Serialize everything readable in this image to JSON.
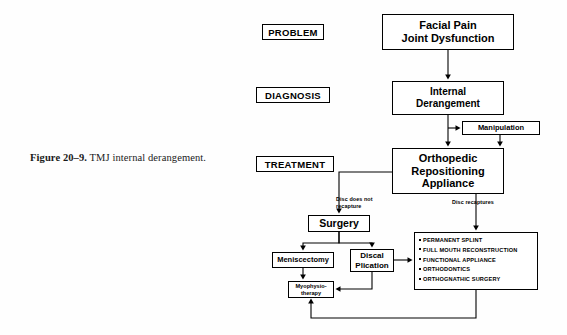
{
  "figure": {
    "caption_number": "Figure 20–9.",
    "caption_text": " TMJ internal derangement."
  },
  "stage_labels": {
    "problem": "PROBLEM",
    "diagnosis": "DIAGNOSIS",
    "treatment": "TREATMENT"
  },
  "nodes": {
    "problem": "Facial Pain\nJoint Dysfunction",
    "problem_line1": "Facial Pain",
    "problem_line2": "Joint Dysfunction",
    "diagnosis_line1": "Internal",
    "diagnosis_line2": "Derangement",
    "manipulation": "Manipulation",
    "treatment_line1": "Orthopedic",
    "treatment_line2": "Repositioning",
    "treatment_line3": "Appliance",
    "surgery": "Surgery",
    "meniscectomy": "Meniscectomy",
    "discal_line1": "Discal",
    "discal_line2": "Plication",
    "myo_line1": "Myophysio-",
    "myo_line2": "therapy"
  },
  "options_box": {
    "items": [
      "PERMANENT SPLINT",
      "FULL MOUTH RECONSTRUCTION",
      "FUNCTIONAL APPLIANCE",
      "ORTHODONTICS",
      "ORTHOGNATHIC SURGERY"
    ]
  },
  "edge_labels": {
    "disc_does_not_recapture_line1": "Disc does not",
    "disc_does_not_recapture_line2": "recapture",
    "disc_recaptures": "Disc recaptures"
  },
  "colors": {
    "line": "#000000",
    "box_fill": "#ffffff",
    "text": "#000000",
    "page": "#fefefe"
  }
}
